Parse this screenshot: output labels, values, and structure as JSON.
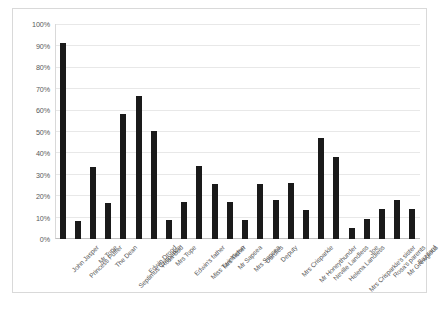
{
  "chart_data": {
    "type": "bar",
    "title": "",
    "subtitle": "",
    "xlabel": "",
    "ylabel": "",
    "ylim": [
      0,
      100
    ],
    "grid": true,
    "legend": false,
    "legend_position": "none",
    "bar_color": "#1a1a1a",
    "gridline_color": "#e8e8e8",
    "axis_color": "#d9d9d9",
    "y_ticks": [
      "0%",
      "10%",
      "20%",
      "30%",
      "40%",
      "50%",
      "60%",
      "70%",
      "80%",
      "90%",
      "100%"
    ],
    "y_tick_values": [
      0,
      10,
      20,
      30,
      40,
      50,
      60,
      70,
      80,
      90,
      100
    ],
    "categories": [
      "John Jasper",
      "Princess Puffer",
      "Mr Tope",
      "The Dean",
      "Septimus Crisparkle",
      "Edwin Drood",
      "Rosa Bud",
      "Mrs Tope",
      "Edwin's father",
      "Miss Twinkleton",
      "Mrs Tisher",
      "Mr Sapsea",
      "Mrs Sapsea",
      "Durdles",
      "Deputy",
      "Mrs Crisparkle",
      "Mr Honeythunder",
      "Neville Landless",
      "Helena Landless",
      "Mrs Crisparkle's sister",
      "Joe",
      "Rosa's parents",
      "Mr Grewgious",
      "Bazzard"
    ],
    "values": [
      91.5,
      8.5,
      33.5,
      17,
      58.5,
      67,
      50.5,
      9,
      17.5,
      34,
      25.5,
      17.5,
      9,
      25.5,
      18,
      26,
      13.5,
      47,
      38.5,
      5,
      9.5,
      14,
      18,
      14
    ]
  }
}
